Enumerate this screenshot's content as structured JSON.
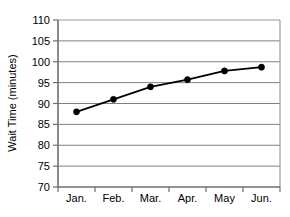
{
  "chart_data": {
    "type": "line",
    "title": "",
    "xlabel": "",
    "ylabel": "Wait Time (minutes)",
    "categories": [
      "Jan.",
      "Feb.",
      "Mar.",
      "Apr.",
      "May",
      "Jun."
    ],
    "values": [
      88,
      91,
      94,
      95.7,
      97.8,
      98.7
    ],
    "series": [
      {
        "name": "Wait Time",
        "values": [
          88,
          91,
          94,
          95.7,
          97.8,
          98.7
        ]
      }
    ],
    "ylim": [
      70,
      110
    ],
    "yticks": [
      70,
      75,
      80,
      85,
      90,
      95,
      100,
      105,
      110
    ],
    "ytick_labels": [
      "70",
      "75",
      "80",
      "85",
      "90",
      "95",
      "100",
      "105",
      "110"
    ],
    "grid": true,
    "grid_axis": "y",
    "legend": false,
    "legend_position": "none",
    "marker": "filled-circle",
    "line_color": "#000000",
    "marker_color": "#000000",
    "grid_color": "#808080",
    "frame_color": "#808080",
    "background_color": "#ffffff"
  }
}
